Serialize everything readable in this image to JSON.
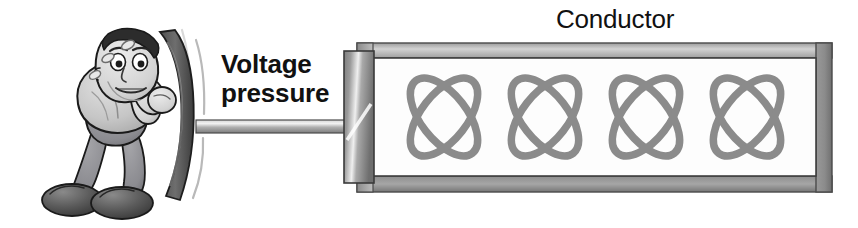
{
  "figure": {
    "background_color": "#ffffff",
    "width": 858,
    "height": 228
  },
  "labels": {
    "voltage_pressure": "Voltage\npressure",
    "conductor": "Conductor"
  },
  "character": {
    "name": "straining-man-pushing",
    "description": "Cartoon man leaning forward pushing a curved plate",
    "sweat_drop_count": 3,
    "colors": {
      "shirt": "#c9c9c9",
      "pants": "#8f8f93",
      "shoes": "#4a4a4a",
      "skin": "#d8d8d8",
      "hair": "#2e2e2e",
      "outline": "#1a1a1a"
    }
  },
  "piston": {
    "name": "piston-assembly",
    "plate_color": "#6b6b6b",
    "rod_color": "#b4b4b4",
    "motion_line_count": 3
  },
  "conductor": {
    "name": "conductor-box",
    "frame_color": "#a8a8a8",
    "frame_shadow_color": "#5f5f5f",
    "interior_color": "#fcfcfc",
    "atom_count": 4,
    "atom_color": "#8a8a8a",
    "atom_label": "atom"
  },
  "colors": {
    "text": "#111111",
    "background": "#ffffff"
  }
}
